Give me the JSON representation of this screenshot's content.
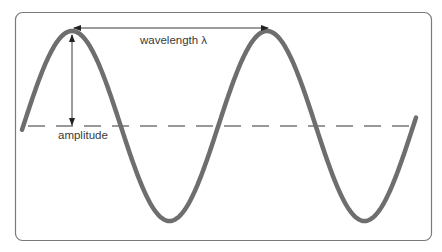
{
  "diagram": {
    "labels": {
      "wavelength": "wavelength λ",
      "amplitude": "amplitude"
    },
    "colors": {
      "wave": "#6e6e6e",
      "frame": "#7a7a7a",
      "arrow": "#222222",
      "midline": "#333333",
      "text": "#3a3a3a"
    },
    "wave": {
      "midline_y": 126,
      "amplitude_px": 95,
      "wavelength_px": 195,
      "x_start": 22,
      "x_end": 416,
      "peaks_x": [
        72,
        267
      ],
      "troughs_x": [
        170,
        365
      ]
    }
  }
}
